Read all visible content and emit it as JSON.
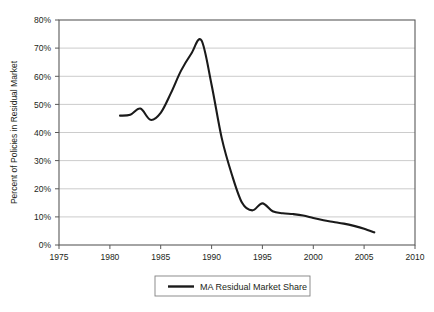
{
  "chart_data": {
    "type": "line",
    "title": "",
    "xlabel": "",
    "ylabel": "Percent of Policies in Residual Market",
    "xlim": [
      1975,
      2010
    ],
    "ylim": [
      0,
      80
    ],
    "grid": true,
    "grid_axis": "y",
    "legend_position": "bottom-center",
    "x_tick_labels": [
      "1975",
      "1980",
      "1985",
      "1990",
      "1995",
      "2000",
      "2005",
      "2010"
    ],
    "x_ticks": [
      1975,
      1980,
      1985,
      1990,
      1995,
      2000,
      2005,
      2010
    ],
    "y_tick_labels": [
      "0%",
      "10%",
      "20%",
      "30%",
      "40%",
      "50%",
      "60%",
      "70%",
      "80%"
    ],
    "y_ticks": [
      0,
      10,
      20,
      30,
      40,
      50,
      60,
      70,
      80
    ],
    "series": [
      {
        "name": "MA Residual Market Share",
        "color": "#1a1a1a",
        "x": [
          1981,
          1982,
          1983,
          1984,
          1985,
          1986,
          1987,
          1988,
          1989,
          1990,
          1991,
          1992,
          1993,
          1994,
          1995,
          1996,
          1997,
          1998,
          1999,
          2000,
          2001,
          2002,
          2003,
          2004,
          2005,
          2006
        ],
        "values": [
          46.0,
          46.3,
          48.5,
          44.5,
          47.0,
          54.0,
          62.0,
          68.0,
          72.8,
          57.0,
          38.0,
          25.0,
          15.0,
          12.3,
          14.8,
          12.0,
          11.3,
          11.0,
          10.5,
          9.6,
          8.8,
          8.2,
          7.6,
          6.8,
          5.8,
          4.5
        ]
      }
    ]
  },
  "legend": {
    "entries": [
      {
        "label": "MA Residual Market Share"
      }
    ]
  }
}
